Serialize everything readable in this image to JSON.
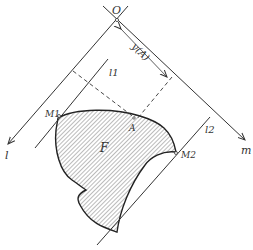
{
  "figure": {
    "labels": {
      "origin": "O",
      "distance": "y(A)",
      "line1": "l1",
      "line2": "l2",
      "point_m1": "M1",
      "point_m2": "M2",
      "point_a": "A",
      "region": "F",
      "axis_l": "l",
      "axis_m": "m"
    },
    "colors": {
      "line": "#333333",
      "hatch": "#555555",
      "background": "#ffffff"
    }
  }
}
